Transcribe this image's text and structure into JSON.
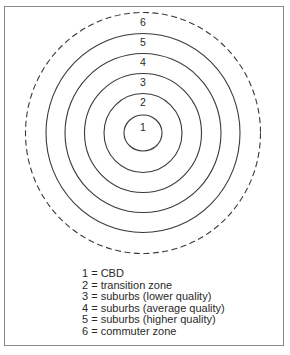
{
  "diagram": {
    "center": {
      "x": 143,
      "y": 133
    },
    "stroke_color": "#3a3a3a",
    "border_color": "#8a8a8a",
    "rings": [
      {
        "number": "1",
        "rx": 19,
        "ry": 18,
        "dashed": false,
        "label_y": 131
      },
      {
        "number": "2",
        "rx": 39,
        "ry": 39.5,
        "dashed": false,
        "label_y": 106
      },
      {
        "number": "3",
        "rx": 58.5,
        "ry": 59.5,
        "dashed": false,
        "label_y": 86
      },
      {
        "number": "4",
        "rx": 78,
        "ry": 79.5,
        "dashed": false,
        "label_y": 66
      },
      {
        "number": "5",
        "rx": 97,
        "ry": 99.5,
        "dashed": false,
        "label_y": 46
      },
      {
        "number": "6",
        "rx": 117.5,
        "ry": 120.5,
        "dashed": true,
        "label_y": 26
      }
    ]
  },
  "legend": {
    "items": [
      {
        "number": "1",
        "text": "1 = CBD"
      },
      {
        "number": "2",
        "text": "2 = transition zone"
      },
      {
        "number": "3",
        "text": "3 = suburbs (lower quality)"
      },
      {
        "number": "4",
        "text": "4 = suburbs (average quality)"
      },
      {
        "number": "5",
        "text": "5 = suburbs (higher quality)"
      },
      {
        "number": "6",
        "text": "6 = commuter zone"
      }
    ]
  }
}
